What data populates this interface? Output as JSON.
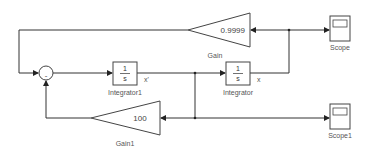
{
  "diagram": {
    "type": "simulink-model",
    "blocks": {
      "sum": {
        "name": "Sum",
        "sign": "-"
      },
      "integrator1": {
        "name": "Integrator1",
        "num": "1",
        "den": "s",
        "output_signal": "x'"
      },
      "integrator": {
        "name": "Integrator",
        "num": "1",
        "den": "s",
        "output_signal": "x"
      },
      "gain": {
        "name": "Gain",
        "value": "0.9999"
      },
      "gain1": {
        "name": "Gain1",
        "value": "100"
      },
      "scope": {
        "name": "Scope"
      },
      "scope1": {
        "name": "Scope1"
      }
    },
    "connections": [
      {
        "from": "sum",
        "to": "integrator1"
      },
      {
        "from": "integrator1",
        "to": "integrator",
        "signal": "x'"
      },
      {
        "from": "integrator1",
        "to": "gain1",
        "signal": "x'"
      },
      {
        "from": "integrator1",
        "to": "scope1",
        "signal": "x'"
      },
      {
        "from": "integrator",
        "to": "gain",
        "signal": "x"
      },
      {
        "from": "integrator",
        "to": "scope",
        "signal": "x"
      },
      {
        "from": "gain",
        "to": "sum"
      },
      {
        "from": "gain1",
        "to": "sum"
      }
    ],
    "colors": {
      "line": "#333333",
      "background": "#ffffff"
    }
  }
}
